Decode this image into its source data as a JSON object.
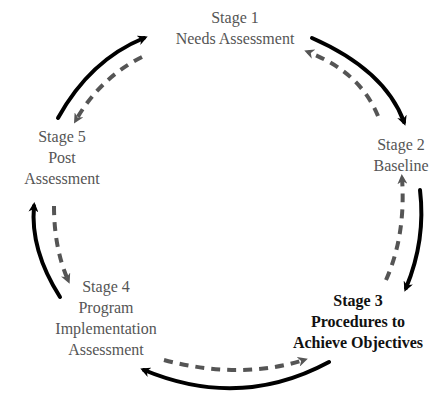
{
  "diagram": {
    "type": "cycle",
    "colors": {
      "solid_arrow": "#000000",
      "dashed_arrow": "#555555",
      "stage_text": "#555555",
      "highlight_text": "#111111",
      "background": "#ffffff"
    },
    "stages": [
      {
        "id": "stage1",
        "title": "Stage 1",
        "lines": [
          "Needs Assessment"
        ],
        "highlighted": false
      },
      {
        "id": "stage2",
        "title": "Stage 2",
        "lines": [
          "Baseline"
        ],
        "highlighted": false
      },
      {
        "id": "stage3",
        "title": "Stage 3",
        "lines": [
          "Procedures to",
          "Achieve Objectives"
        ],
        "highlighted": true
      },
      {
        "id": "stage4",
        "title": "Stage 4",
        "lines": [
          "Program",
          "Implementation",
          "Assessment"
        ],
        "highlighted": false
      },
      {
        "id": "stage5",
        "title": "Stage 5",
        "lines": [
          "Post",
          "Assessment"
        ],
        "highlighted": false
      }
    ],
    "connections": [
      {
        "from": "Stage 1",
        "to": "Stage 2",
        "style": "solid"
      },
      {
        "from": "Stage 2",
        "to": "Stage 1",
        "style": "dashed"
      },
      {
        "from": "Stage 2",
        "to": "Stage 3",
        "style": "solid"
      },
      {
        "from": "Stage 3",
        "to": "Stage 2",
        "style": "dashed"
      },
      {
        "from": "Stage 3",
        "to": "Stage 4",
        "style": "solid"
      },
      {
        "from": "Stage 4",
        "to": "Stage 3",
        "style": "dashed"
      },
      {
        "from": "Stage 4",
        "to": "Stage 5",
        "style": "solid"
      },
      {
        "from": "Stage 5",
        "to": "Stage 4",
        "style": "dashed"
      },
      {
        "from": "Stage 5",
        "to": "Stage 1",
        "style": "solid"
      },
      {
        "from": "Stage 1",
        "to": "Stage 5",
        "style": "dashed"
      }
    ]
  }
}
